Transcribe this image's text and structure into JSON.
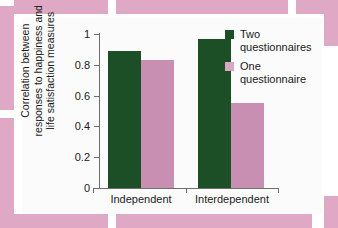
{
  "chart_data": {
    "type": "bar",
    "title": "",
    "xlabel": "",
    "ylabel_lines": [
      "Correlation between",
      "responses to happiness and",
      "life satisfaction measures"
    ],
    "categories": [
      "Independent",
      "Interdependent"
    ],
    "series": [
      {
        "name": "Two questionnaires",
        "color": "#1d4f26",
        "values": [
          0.89,
          0.97
        ]
      },
      {
        "name": "One questionnaire",
        "color": "#c98fb3",
        "values": [
          0.83,
          0.55
        ]
      }
    ],
    "ylim": [
      0,
      1
    ],
    "yticks": [
      "0",
      "0.2",
      "0.4",
      "0.6",
      "0.8",
      "1"
    ],
    "ytick_values": [
      0,
      0.2,
      0.4,
      0.6,
      0.8,
      1
    ],
    "grid": false,
    "legend_position": "top-right"
  },
  "legend": {
    "entries": [
      {
        "line1": "Two",
        "line2": "questionnaires"
      },
      {
        "line1": "One",
        "line2": "questionnaire"
      }
    ]
  },
  "colors": {
    "series_green": "#1d4f26",
    "series_pink": "#c98fb3",
    "frame_pink": "#dfa8c4",
    "plate": "#fbfbfb",
    "axis": "#6e6e6e",
    "text": "#1a1a1a"
  }
}
